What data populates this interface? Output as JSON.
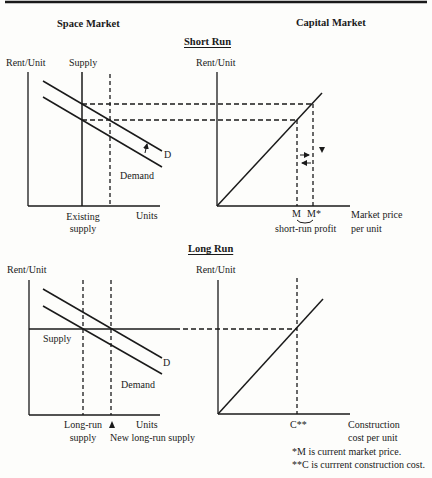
{
  "headers": {
    "space_market": "Space Market",
    "capital_market": "Capital Market",
    "short_run": "Short Run",
    "long_run": "Long Run"
  },
  "short_run": {
    "space": {
      "y_label": "Rent/Unit",
      "supply_label": "Supply",
      "d_label": "D",
      "demand_label": "Demand",
      "x_axis_label": "Units",
      "existing_supply_line1": "Existing",
      "existing_supply_line2": "supply"
    },
    "capital": {
      "y_label": "Rent/Unit",
      "m_label": "M",
      "m_star_label": "M*",
      "profit_label": "short-run profit",
      "x_axis_line1": "Market price",
      "x_axis_line2": "per unit"
    }
  },
  "long_run": {
    "space": {
      "y_label": "Rent/Unit",
      "supply_label": "Supply",
      "d_label": "D",
      "demand_label": "Demand",
      "x_axis_label": "Units",
      "lr_supply_line1": "Long-run",
      "lr_supply_line2": "supply",
      "new_lr_supply": "New long-run supply"
    },
    "capital": {
      "y_label": "Rent/Unit",
      "c_label": "C**",
      "x_axis_line1": "Construction",
      "x_axis_line2": "cost per unit"
    }
  },
  "footnotes": {
    "m_note": "*M is current market price.",
    "c_note": "**C is currrent construction cost."
  },
  "colors": {
    "ink": "#1a1a1a",
    "background": "#fdfdfb"
  }
}
